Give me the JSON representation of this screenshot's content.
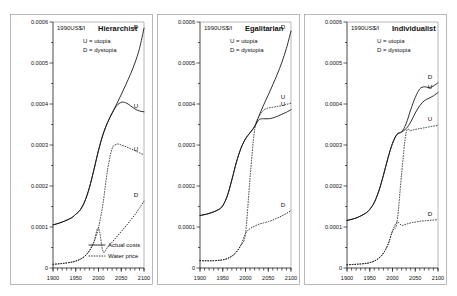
{
  "figure": {
    "unit_label": "1990US$/l",
    "key_utopia": "U = utopia",
    "key_dystopia": "D = dystopia",
    "legend": {
      "actual_costs": "Actual costs",
      "water_price": "Water price"
    }
  },
  "chart_data": {
    "type": "line",
    "title": "",
    "xlabel": "",
    "ylabel": "1990US$/l",
    "xlim": [
      1900,
      2100
    ],
    "ylim": [
      0,
      0.0006
    ],
    "xticks": [
      1900,
      1950,
      2000,
      2050,
      2100
    ],
    "yticks": [
      0,
      0.0001,
      0.0002,
      0.0003,
      0.0004,
      0.0005,
      0.0006
    ],
    "ytick_labels": [
      "0",
      "0.0001",
      "0.0002",
      "0.0003",
      "0.0004",
      "0.0005",
      "0.0006"
    ],
    "xtick_labels": [
      "1900",
      "1950",
      "2000",
      "2050",
      "2100"
    ],
    "minor_xticks": true,
    "minor_yticks": true,
    "grid": false,
    "legend_position": "bottom-center-panel-1",
    "legend_entries": [
      {
        "label": "Actual costs",
        "style": "solid"
      },
      {
        "label": "Water price",
        "style": "dotted"
      }
    ],
    "panels": [
      {
        "name": "Hierarchist",
        "title": "Hierarchist",
        "series": [
          {
            "name": "Actual costs - dystopia",
            "label": "D",
            "style": "solid",
            "x": [
              1900,
              1920,
              1940,
              1950,
              1960,
              1970,
              1980,
              1990,
              2000,
              2010,
              2020,
              2030,
              2040,
              2050,
              2060,
              2070,
              2080,
              2090,
              2100
            ],
            "y": [
              0.000105,
              0.000112,
              0.000122,
              0.000131,
              0.000142,
              0.000163,
              0.000196,
              0.00024,
              0.000287,
              0.000326,
              0.000355,
              0.000378,
              0.0004,
              0.000423,
              0.000447,
              0.000472,
              0.0005,
              0.000535,
              0.000585
            ]
          },
          {
            "name": "Actual costs - utopia",
            "label": "U",
            "style": "solid",
            "x": [
              1900,
              1920,
              1940,
              1950,
              1960,
              1970,
              1980,
              1990,
              2000,
              2010,
              2020,
              2030,
              2040,
              2050,
              2060,
              2070,
              2080,
              2090,
              2100
            ],
            "y": [
              0.000105,
              0.000112,
              0.000122,
              0.000131,
              0.000142,
              0.000163,
              0.000196,
              0.00024,
              0.000287,
              0.000326,
              0.000355,
              0.000378,
              0.000396,
              0.000404,
              0.000403,
              0.000396,
              0.000388,
              0.000383,
              0.000381
            ]
          },
          {
            "name": "Water price - utopia",
            "label": "U",
            "style": "dotted",
            "x": [
              1900,
              1920,
              1940,
              1950,
              1960,
              1970,
              1980,
              1990,
              2000,
              2010,
              2020,
              2030,
              2040,
              2050,
              2060,
              2070,
              2080,
              2090,
              2100
            ],
            "y": [
              9e-06,
              1.1e-05,
              1.4e-05,
              1.7e-05,
              2.15e-05,
              2.9e-05,
              4.2e-05,
              6.4e-05,
              9.8e-05,
              0.000158,
              0.00024,
              0.000291,
              0.000302,
              0.0003,
              0.000296,
              0.000291,
              0.000286,
              0.000281,
              0.000276
            ]
          },
          {
            "name": "Water price - dystopia",
            "label": "D",
            "style": "dotted",
            "x": [
              1900,
              1920,
              1940,
              1950,
              1960,
              1970,
              1980,
              1990,
              2000,
              2010,
              2020,
              2030,
              2040,
              2050,
              2060,
              2070,
              2080,
              2090,
              2100
            ],
            "y": [
              9e-06,
              1.1e-05,
              1.4e-05,
              1.7e-05,
              2.15e-05,
              2.9e-05,
              4.2e-05,
              6.4e-05,
              9.8e-05,
              4e-05,
              5.1e-05,
              6.3e-05,
              7.6e-05,
              8.9e-05,
              0.000102,
              0.000116,
              0.00013,
              0.000146,
              0.000163
            ]
          }
        ]
      },
      {
        "name": "Egalitarian",
        "title": "Egalitarian",
        "series": [
          {
            "name": "Actual costs - dystopia",
            "label": "D",
            "style": "solid",
            "x": [
              1900,
              1920,
              1940,
              1950,
              1960,
              1970,
              1980,
              1990,
              2000,
              2010,
              2020,
              2030,
              2040,
              2050,
              2060,
              2070,
              2080,
              2090,
              2100
            ],
            "y": [
              0.000128,
              0.000133,
              0.000142,
              0.000152,
              0.000176,
              0.000215,
              0.000258,
              0.000292,
              0.000315,
              0.00033,
              0.000345,
              0.000372,
              0.000398,
              0.000422,
              0.000447,
              0.000473,
              0.000502,
              0.000536,
              0.000578
            ]
          },
          {
            "name": "Actual costs - utopia",
            "label": "U",
            "style": "solid",
            "x": [
              1900,
              1920,
              1940,
              1950,
              1960,
              1970,
              1980,
              1990,
              2000,
              2010,
              2020,
              2030,
              2040,
              2050,
              2060,
              2070,
              2080,
              2090,
              2100
            ],
            "y": [
              0.000128,
              0.000133,
              0.000142,
              0.000152,
              0.000176,
              0.000215,
              0.000258,
              0.000292,
              0.000315,
              0.00033,
              0.000345,
              0.000362,
              0.000364,
              0.000364,
              0.000366,
              0.00037,
              0.000375,
              0.00038,
              0.000386
            ]
          },
          {
            "name": "Water price - utopia",
            "label": "U",
            "style": "dotted",
            "x": [
              1900,
              1920,
              1940,
              1950,
              1960,
              1970,
              1980,
              1990,
              2000,
              2010,
              2020,
              2030,
              2040,
              2050,
              2060,
              2070,
              2080,
              2090,
              2100
            ],
            "y": [
              1.8e-05,
              1.75e-05,
              1.85e-05,
              2e-05,
              2.3e-05,
              2.9e-05,
              3.9e-05,
              5.6e-05,
              8.4e-05,
              0.00022,
              0.000337,
              0.00037,
              0.000385,
              0.00039,
              0.000392,
              0.000394,
              0.000396,
              0.000399,
              0.000402
            ]
          },
          {
            "name": "Water price - dystopia",
            "label": "D",
            "style": "dotted",
            "x": [
              1900,
              1920,
              1940,
              1950,
              1960,
              1970,
              1980,
              1990,
              2000,
              2010,
              2020,
              2030,
              2040,
              2050,
              2060,
              2070,
              2080,
              2090,
              2100
            ],
            "y": [
              1.8e-05,
              1.75e-05,
              1.85e-05,
              2e-05,
              2.3e-05,
              2.9e-05,
              3.9e-05,
              5.6e-05,
              8.4e-05,
              9.6e-05,
              0.000102,
              0.000107,
              0.00011,
              0.000113,
              0.000117,
              0.000122,
              0.000127,
              0.000133,
              0.00014
            ]
          }
        ]
      },
      {
        "name": "Individualist",
        "title": "Individualist",
        "series": [
          {
            "name": "Actual costs - dystopia",
            "label": "D",
            "style": "solid",
            "x": [
              1900,
              1920,
              1940,
              1950,
              1960,
              1970,
              1980,
              1990,
              2000,
              2010,
              2020,
              2030,
              2040,
              2050,
              2060,
              2070,
              2080,
              2090,
              2100
            ],
            "y": [
              0.000116,
              0.000122,
              0.000133,
              0.000143,
              0.00016,
              0.000188,
              0.000226,
              0.000268,
              0.000304,
              0.000326,
              0.000332,
              0.000352,
              0.000386,
              0.000416,
              0.000437,
              0.000442,
              0.00044,
              0.000444,
              0.000452
            ]
          },
          {
            "name": "Actual costs - utopia",
            "label": "U",
            "style": "solid",
            "x": [
              1900,
              1920,
              1940,
              1950,
              1960,
              1970,
              1980,
              1990,
              2000,
              2010,
              2020,
              2030,
              2040,
              2050,
              2060,
              2070,
              2080,
              2090,
              2100
            ],
            "y": [
              0.000116,
              0.000122,
              0.000133,
              0.000143,
              0.00016,
              0.000188,
              0.000226,
              0.000268,
              0.000304,
              0.000326,
              0.000332,
              0.00034,
              0.000356,
              0.000378,
              0.000396,
              0.000408,
              0.000414,
              0.00042,
              0.000428
            ]
          },
          {
            "name": "Water price - utopia",
            "label": "U",
            "style": "dotted",
            "x": [
              1900,
              1920,
              1940,
              1950,
              1960,
              1970,
              1980,
              1990,
              2000,
              2010,
              2020,
              2030,
              2040,
              2050,
              2060,
              2070,
              2080,
              2090,
              2100
            ],
            "y": [
              8e-06,
              9e-06,
              1.1e-05,
              1.3e-05,
              1.7e-05,
              2.4e-05,
              3.6e-05,
              5.7e-05,
              9e-05,
              0.000112,
              0.00023,
              0.00033,
              0.000335,
              0.000338,
              0.00034,
              0.000342,
              0.000344,
              0.000346,
              0.000348
            ]
          },
          {
            "name": "Water price - dystopia",
            "label": "D",
            "style": "dotted",
            "x": [
              1900,
              1920,
              1940,
              1950,
              1960,
              1970,
              1980,
              1990,
              2000,
              2010,
              2020,
              2030,
              2040,
              2050,
              2060,
              2070,
              2080,
              2090,
              2100
            ],
            "y": [
              8e-06,
              9e-06,
              1.1e-05,
              1.3e-05,
              1.7e-05,
              2.4e-05,
              3.6e-05,
              5.7e-05,
              9e-05,
              0.000112,
              0.000104,
              0.000107,
              0.00011,
              0.000112,
              0.000114,
              0.000115,
              0.000116,
              0.000117,
              0.000118
            ]
          }
        ]
      }
    ]
  }
}
